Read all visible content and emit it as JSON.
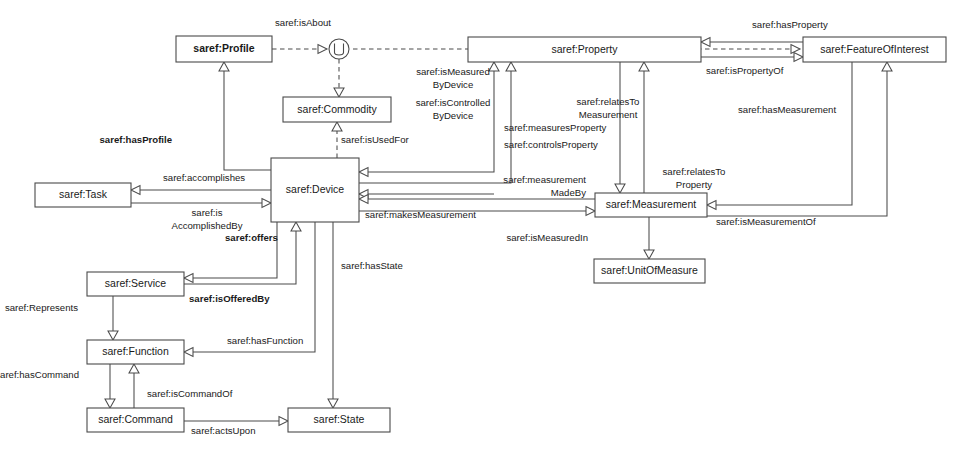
{
  "diagram": {
    "type": "ontology-class-diagram",
    "stroke_color": "#4a4a4a",
    "background_color": "#ffffff",
    "nodes": [
      {
        "id": "profile",
        "label": "saref:Profile",
        "bold": true,
        "x": 176,
        "y": 36,
        "w": 96,
        "h": 26
      },
      {
        "id": "commodity",
        "label": "saref:Commodity",
        "bold": false,
        "x": 283,
        "y": 97,
        "w": 108,
        "h": 25
      },
      {
        "id": "property",
        "label": "saref:Property",
        "bold": false,
        "x": 468,
        "y": 37,
        "w": 233,
        "h": 25
      },
      {
        "id": "featureofinterest",
        "label": "saref:FeatureOfInterest",
        "bold": false,
        "x": 803,
        "y": 37,
        "w": 143,
        "h": 25
      },
      {
        "id": "task",
        "label": "saref:Task",
        "bold": false,
        "x": 35,
        "y": 183,
        "w": 96,
        "h": 24
      },
      {
        "id": "device",
        "label": "saref:Device",
        "bold": false,
        "x": 271,
        "y": 158,
        "w": 88,
        "h": 64
      },
      {
        "id": "measurement",
        "label": "saref:Measurement",
        "bold": false,
        "x": 595,
        "y": 193,
        "w": 112,
        "h": 24
      },
      {
        "id": "unitofmeasure",
        "label": "saref:UnitOfMeasure",
        "bold": false,
        "x": 594,
        "y": 259,
        "w": 111,
        "h": 24
      },
      {
        "id": "service",
        "label": "saref:Service",
        "bold": false,
        "x": 87,
        "y": 272,
        "w": 97,
        "h": 24
      },
      {
        "id": "function",
        "label": "saref:Function",
        "bold": false,
        "x": 87,
        "y": 340,
        "w": 97,
        "h": 24
      },
      {
        "id": "command",
        "label": "saref:Command",
        "bold": false,
        "x": 87,
        "y": 408,
        "w": 97,
        "h": 24
      },
      {
        "id": "state",
        "label": "saref:State",
        "bold": false,
        "x": 288,
        "y": 408,
        "w": 102,
        "h": 24
      }
    ],
    "junction": {
      "id": "union-junction",
      "label": "union-junction",
      "cx": 339,
      "cy": 49,
      "r": 10
    },
    "edge_labels": [
      {
        "id": "isAbout",
        "lines": [
          "saref:isAbout"
        ],
        "x": 275,
        "y": 23,
        "anchor": "start",
        "bold": false
      },
      {
        "id": "isMeasuredByDevice",
        "lines": [
          "saref:isMeasured",
          "ByDevice"
        ],
        "x": 453,
        "y": 72,
        "anchor": "middle",
        "bold": false
      },
      {
        "id": "isControlledByDevice",
        "lines": [
          "saref:isControlled",
          "ByDevice"
        ],
        "x": 453,
        "y": 103,
        "anchor": "middle",
        "bold": false
      },
      {
        "id": "hasProfile",
        "lines": [
          "saref:hasProfile"
        ],
        "x": 172,
        "y": 140,
        "anchor": "end",
        "bold": true
      },
      {
        "id": "isUsedFor",
        "lines": [
          "saref:isUsedFor"
        ],
        "x": 341,
        "y": 140,
        "anchor": "start",
        "bold": false
      },
      {
        "id": "relatesToMeasurement",
        "lines": [
          "saref:relatesTo",
          "Measurement"
        ],
        "x": 608,
        "y": 102,
        "anchor": "middle",
        "bold": false
      },
      {
        "id": "hasProperty",
        "lines": [
          "saref:hasProperty"
        ],
        "x": 752,
        "y": 25,
        "anchor": "start",
        "bold": false
      },
      {
        "id": "isPropertyOf",
        "lines": [
          "saref:isPropertyOf"
        ],
        "x": 706,
        "y": 71,
        "anchor": "start",
        "bold": false
      },
      {
        "id": "hasMeasurement",
        "lines": [
          "saref:hasMeasurement"
        ],
        "x": 738,
        "y": 110,
        "anchor": "start",
        "bold": false
      },
      {
        "id": "measuresProperty",
        "lines": [
          "saref:measuresProperty"
        ],
        "x": 504,
        "y": 128,
        "anchor": "start",
        "bold": false
      },
      {
        "id": "controlsProperty",
        "lines": [
          "saref:controlsProperty"
        ],
        "x": 504,
        "y": 145,
        "anchor": "start",
        "bold": false
      },
      {
        "id": "relatesToProperty",
        "lines": [
          "saref:relatesTo",
          "Property"
        ],
        "x": 694,
        "y": 172,
        "anchor": "middle",
        "bold": false
      },
      {
        "id": "measurementMadeBy",
        "lines": [
          "saref:measurement",
          "MadeBy"
        ],
        "x": 586,
        "y": 180,
        "anchor": "end",
        "bold": false
      },
      {
        "id": "accomplishes",
        "lines": [
          "saref:accomplishes"
        ],
        "x": 163,
        "y": 178,
        "anchor": "start",
        "bold": false
      },
      {
        "id": "isAccomplishedBy",
        "lines": [
          "saref:is",
          "AccomplishedBy"
        ],
        "x": 207,
        "y": 213,
        "anchor": "middle",
        "bold": false
      },
      {
        "id": "makesMeasurement",
        "lines": [
          "saref:makesMeasurement"
        ],
        "x": 365,
        "y": 215,
        "anchor": "start",
        "bold": false
      },
      {
        "id": "isMeasurementOf",
        "lines": [
          "saref:isMeasurementOf"
        ],
        "x": 716,
        "y": 222,
        "anchor": "start",
        "bold": false
      },
      {
        "id": "isMeasuredIn",
        "lines": [
          "saref:isMeasuredIn"
        ],
        "x": 588,
        "y": 238,
        "anchor": "end",
        "bold": false
      },
      {
        "id": "offers",
        "lines": [
          "saref:offers"
        ],
        "x": 225,
        "y": 238,
        "anchor": "start",
        "bold": true
      },
      {
        "id": "hasState",
        "lines": [
          "saref:hasState"
        ],
        "x": 341,
        "y": 266,
        "anchor": "start",
        "bold": false
      },
      {
        "id": "isOfferedBy",
        "lines": [
          "saref:isOfferedBy"
        ],
        "x": 189,
        "y": 299,
        "anchor": "start",
        "bold": true
      },
      {
        "id": "Represents",
        "lines": [
          "saref:Represents"
        ],
        "x": 78,
        "y": 308,
        "anchor": "end",
        "bold": false
      },
      {
        "id": "hasFunction",
        "lines": [
          "saref:hasFunction"
        ],
        "x": 227,
        "y": 341,
        "anchor": "start",
        "bold": false
      },
      {
        "id": "hasCommand",
        "lines": [
          "saref:hasCommand"
        ],
        "x": 79,
        "y": 375,
        "anchor": "end",
        "bold": false
      },
      {
        "id": "isCommandOf",
        "lines": [
          "saref:isCommandOf"
        ],
        "x": 147,
        "y": 394,
        "anchor": "start",
        "bold": false
      },
      {
        "id": "actsUpon",
        "lines": [
          "saref:actsUpon"
        ],
        "x": 191,
        "y": 431,
        "anchor": "start",
        "bold": false
      }
    ],
    "relationships": [
      {
        "from": "profile",
        "to": "union-junction",
        "label": "saref:isAbout",
        "style": "dashed"
      },
      {
        "from": "union-junction",
        "to": "property",
        "label": "saref:isAbout",
        "style": "dashed"
      },
      {
        "from": "union-junction",
        "to": "commodity",
        "label": "",
        "style": "dashed"
      },
      {
        "from": "commodity",
        "to": "device",
        "label": "saref:isUsedFor",
        "style": "dashed"
      },
      {
        "from": "device",
        "to": "profile",
        "label": "saref:hasProfile",
        "style": "solid"
      },
      {
        "from": "device",
        "to": "property",
        "label": "saref:measuresProperty",
        "style": "solid"
      },
      {
        "from": "device",
        "to": "property",
        "label": "saref:controlsProperty",
        "style": "solid"
      },
      {
        "from": "property",
        "to": "device",
        "label": "saref:isMeasuredByDevice",
        "style": "solid"
      },
      {
        "from": "property",
        "to": "device",
        "label": "saref:isControlledByDevice",
        "style": "solid"
      },
      {
        "from": "device",
        "to": "task",
        "label": "saref:accomplishes",
        "style": "solid"
      },
      {
        "from": "task",
        "to": "device",
        "label": "saref:isAccomplishedBy",
        "style": "solid"
      },
      {
        "from": "device",
        "to": "measurement",
        "label": "saref:makesMeasurement",
        "style": "solid"
      },
      {
        "from": "measurement",
        "to": "device",
        "label": "saref:measurementMadeBy",
        "style": "solid"
      },
      {
        "from": "measurement",
        "to": "property",
        "label": "saref:relatesToProperty",
        "style": "solid"
      },
      {
        "from": "property",
        "to": "measurement",
        "label": "saref:relatesToMeasurement",
        "style": "solid"
      },
      {
        "from": "featureofinterest",
        "to": "property",
        "label": "saref:hasProperty",
        "style": "solid"
      },
      {
        "from": "property",
        "to": "featureofinterest",
        "label": "saref:isPropertyOf",
        "style": "solid"
      },
      {
        "from": "featureofinterest",
        "to": "measurement",
        "label": "saref:hasMeasurement",
        "style": "solid"
      },
      {
        "from": "measurement",
        "to": "featureofinterest",
        "label": "saref:isMeasurementOf",
        "style": "solid"
      },
      {
        "from": "measurement",
        "to": "unitofmeasure",
        "label": "saref:isMeasuredIn",
        "style": "solid"
      },
      {
        "from": "device",
        "to": "service",
        "label": "saref:offers",
        "style": "solid"
      },
      {
        "from": "service",
        "to": "device",
        "label": "saref:isOfferedBy",
        "style": "solid"
      },
      {
        "from": "service",
        "to": "function",
        "label": "saref:Represents",
        "style": "solid"
      },
      {
        "from": "device",
        "to": "function",
        "label": "saref:hasFunction",
        "style": "solid"
      },
      {
        "from": "device",
        "to": "state",
        "label": "saref:hasState",
        "style": "solid"
      },
      {
        "from": "function",
        "to": "command",
        "label": "saref:hasCommand",
        "style": "solid"
      },
      {
        "from": "command",
        "to": "function",
        "label": "saref:isCommandOf",
        "style": "solid"
      },
      {
        "from": "command",
        "to": "state",
        "label": "saref:actsUpon",
        "style": "solid"
      }
    ]
  }
}
